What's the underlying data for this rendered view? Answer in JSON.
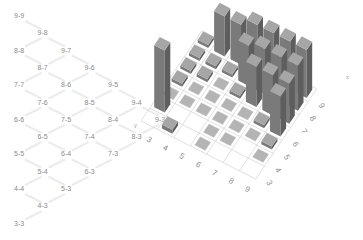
{
  "tree": {
    "nodes": [
      {
        "label": "9-9",
        "col": 0,
        "row": 0
      },
      {
        "label": "9-8",
        "col": 1,
        "row": 1
      },
      {
        "label": "8-8",
        "col": 0,
        "row": 2
      },
      {
        "label": "9-7",
        "col": 2,
        "row": 2
      },
      {
        "label": "8-7",
        "col": 1,
        "row": 3
      },
      {
        "label": "9-6",
        "col": 3,
        "row": 3
      },
      {
        "label": "7-7",
        "col": 0,
        "row": 4
      },
      {
        "label": "8-6",
        "col": 2,
        "row": 4
      },
      {
        "label": "9-5",
        "col": 4,
        "row": 4
      },
      {
        "label": "7-6",
        "col": 1,
        "row": 5
      },
      {
        "label": "8-5",
        "col": 3,
        "row": 5
      },
      {
        "label": "9-4",
        "col": 5,
        "row": 5
      },
      {
        "label": "6-6",
        "col": 0,
        "row": 6
      },
      {
        "label": "7-5",
        "col": 2,
        "row": 6
      },
      {
        "label": "8-4",
        "col": 4,
        "row": 6
      },
      {
        "label": "9-3",
        "col": 6,
        "row": 6
      },
      {
        "label": "6-5",
        "col": 1,
        "row": 7
      },
      {
        "label": "7-4",
        "col": 3,
        "row": 7
      },
      {
        "label": "8-3",
        "col": 5,
        "row": 7
      },
      {
        "label": "5-5",
        "col": 0,
        "row": 8
      },
      {
        "label": "6-4",
        "col": 2,
        "row": 8
      },
      {
        "label": "7-3",
        "col": 4,
        "row": 8
      },
      {
        "label": "5-4",
        "col": 1,
        "row": 9
      },
      {
        "label": "6-3",
        "col": 3,
        "row": 9
      },
      {
        "label": "4-4",
        "col": 0,
        "row": 10
      },
      {
        "label": "5-3",
        "col": 2,
        "row": 10
      },
      {
        "label": "4-3",
        "col": 1,
        "row": 11
      },
      {
        "label": "3-3",
        "col": 0,
        "row": 12
      }
    ]
  },
  "chart_data": {
    "type": "bar3d",
    "title": "",
    "xlabel": "x",
    "ylabel": "y",
    "x_ticks": [
      "3",
      "4",
      "5",
      "6",
      "7",
      "8",
      "9"
    ],
    "y_ticks": [
      "3",
      "4",
      "5",
      "6",
      "7",
      "8",
      "9"
    ],
    "grid": true,
    "bar_color": "#8c8c8c",
    "flat_marker_color": "#b4b4b4",
    "bars": [
      {
        "x": 3,
        "y": 4,
        "h": 62
      },
      {
        "x": 3,
        "y": 5,
        "h": 0
      },
      {
        "x": 3,
        "y": 6,
        "h": 3
      },
      {
        "x": 3,
        "y": 7,
        "h": 3
      },
      {
        "x": 3,
        "y": 8,
        "h": 3
      },
      {
        "x": 3,
        "y": 9,
        "h": 3
      },
      {
        "x": 4,
        "y": 3,
        "h": 4
      },
      {
        "x": 4,
        "y": 5,
        "h": 0
      },
      {
        "x": 4,
        "y": 6,
        "h": 0
      },
      {
        "x": 4,
        "y": 7,
        "h": 3
      },
      {
        "x": 4,
        "y": 8,
        "h": 3
      },
      {
        "x": 4,
        "y": 9,
        "h": 40
      },
      {
        "x": 5,
        "y": 5,
        "h": 0
      },
      {
        "x": 5,
        "y": 6,
        "h": 0
      },
      {
        "x": 5,
        "y": 7,
        "h": 0
      },
      {
        "x": 5,
        "y": 8,
        "h": 3
      },
      {
        "x": 5,
        "y": 9,
        "h": 40
      },
      {
        "x": 6,
        "y": 3,
        "h": 0
      },
      {
        "x": 6,
        "y": 4,
        "h": 0
      },
      {
        "x": 6,
        "y": 5,
        "h": 0
      },
      {
        "x": 6,
        "y": 6,
        "h": 0
      },
      {
        "x": 6,
        "y": 7,
        "h": 3
      },
      {
        "x": 6,
        "y": 8,
        "h": 40
      },
      {
        "x": 6,
        "y": 9,
        "h": 48
      },
      {
        "x": 7,
        "y": 4,
        "h": 0
      },
      {
        "x": 7,
        "y": 5,
        "h": 0
      },
      {
        "x": 7,
        "y": 6,
        "h": 0
      },
      {
        "x": 7,
        "y": 7,
        "h": 40
      },
      {
        "x": 7,
        "y": 8,
        "h": 45
      },
      {
        "x": 7,
        "y": 9,
        "h": 48
      },
      {
        "x": 8,
        "y": 5,
        "h": 0
      },
      {
        "x": 8,
        "y": 6,
        "h": 3
      },
      {
        "x": 8,
        "y": 7,
        "h": 40
      },
      {
        "x": 8,
        "y": 8,
        "h": 45
      },
      {
        "x": 8,
        "y": 9,
        "h": 48
      },
      {
        "x": 9,
        "y": 4,
        "h": 0
      },
      {
        "x": 9,
        "y": 5,
        "h": 3
      },
      {
        "x": 9,
        "y": 6,
        "h": 40
      },
      {
        "x": 9,
        "y": 7,
        "h": 40
      },
      {
        "x": 9,
        "y": 8,
        "h": 45
      },
      {
        "x": 9,
        "y": 9,
        "h": 48
      }
    ]
  }
}
